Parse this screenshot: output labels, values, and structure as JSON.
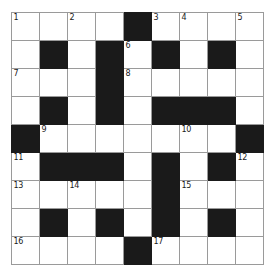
{
  "puzzle": {
    "type": "crossword-grid",
    "rows": 9,
    "columns": 9,
    "cell_size_px": 27,
    "colors": {
      "background": "#ffffff",
      "cell_fill": "#ffffff",
      "block_fill": "#1a1a1a",
      "grid_line": "#9a9a9a",
      "number_text": "#1a1a1a"
    },
    "legend": {
      "0": "white (fillable) cell",
      "1": "black (blocked) cell"
    },
    "grid": [
      [
        0,
        0,
        0,
        0,
        1,
        0,
        0,
        0,
        0
      ],
      [
        0,
        1,
        0,
        1,
        0,
        1,
        0,
        1,
        0
      ],
      [
        0,
        0,
        0,
        1,
        0,
        0,
        0,
        0,
        0
      ],
      [
        0,
        1,
        0,
        1,
        0,
        1,
        1,
        1,
        0
      ],
      [
        1,
        0,
        0,
        0,
        0,
        0,
        0,
        0,
        1
      ],
      [
        0,
        1,
        1,
        1,
        0,
        1,
        0,
        1,
        0
      ],
      [
        0,
        0,
        0,
        0,
        0,
        1,
        0,
        0,
        0
      ],
      [
        0,
        1,
        0,
        1,
        0,
        1,
        0,
        1,
        0
      ],
      [
        0,
        0,
        0,
        0,
        1,
        0,
        0,
        0,
        0
      ]
    ],
    "numbers": [
      {
        "label": "1",
        "row": 0,
        "col": 0
      },
      {
        "label": "2",
        "row": 0,
        "col": 2
      },
      {
        "label": "3",
        "row": 0,
        "col": 5
      },
      {
        "label": "4",
        "row": 0,
        "col": 6
      },
      {
        "label": "5",
        "row": 0,
        "col": 8
      },
      {
        "label": "6",
        "row": 1,
        "col": 4
      },
      {
        "label": "7",
        "row": 2,
        "col": 0
      },
      {
        "label": "8",
        "row": 2,
        "col": 4
      },
      {
        "label": "9",
        "row": 4,
        "col": 1
      },
      {
        "label": "10",
        "row": 4,
        "col": 6
      },
      {
        "label": "11",
        "row": 5,
        "col": 0
      },
      {
        "label": "12",
        "row": 5,
        "col": 8
      },
      {
        "label": "13",
        "row": 6,
        "col": 0
      },
      {
        "label": "14",
        "row": 6,
        "col": 2
      },
      {
        "label": "15",
        "row": 6,
        "col": 6
      },
      {
        "label": "16",
        "row": 8,
        "col": 0
      },
      {
        "label": "17",
        "row": 8,
        "col": 5
      }
    ],
    "entries": []
  }
}
